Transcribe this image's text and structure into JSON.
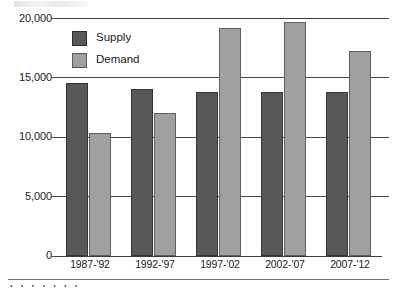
{
  "chart_data": {
    "type": "bar",
    "title": "",
    "subtitle": "",
    "xlabel": "",
    "ylabel": "",
    "categories": [
      "1987-'92",
      "1992-'97",
      "1997-'02",
      "2002-'07",
      "2007-'12"
    ],
    "series": [
      {
        "name": "Supply",
        "color": "#58585a",
        "values": [
          14500,
          14000,
          13800,
          13800,
          13800
        ]
      },
      {
        "name": "Demand",
        "color": "#a0a0a0",
        "values": [
          10300,
          12000,
          19200,
          19700,
          17200
        ]
      }
    ],
    "ylim": [
      0,
      20000
    ],
    "ytick_values": [
      0,
      5000,
      10000,
      15000,
      20000
    ],
    "ytick_labels": [
      "0",
      "5,000",
      "10,000",
      "15,000",
      "20,000"
    ],
    "grid": true,
    "grid_axis": "y",
    "legend_position": "upper-left-inside",
    "legend_entries": [
      "Supply",
      "Demand"
    ],
    "annotations": []
  },
  "figure": {
    "caption_fragment": "l l l l l l l"
  }
}
